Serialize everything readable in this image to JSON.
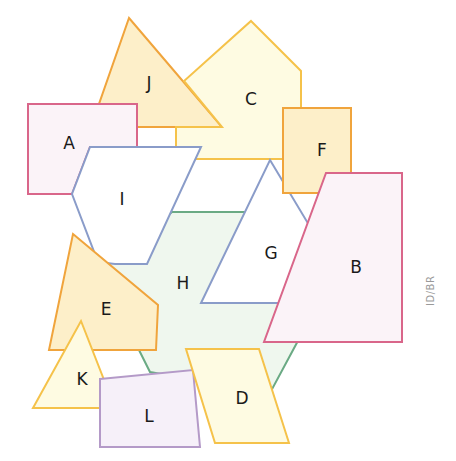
{
  "diagram": {
    "credit": "ID/BR",
    "colors": {
      "pink_stroke": "#d9668a",
      "pink_fill": "#fbf3f8",
      "orange_stroke": "#f0a43c",
      "orange_fill": "#fdefc9",
      "yellow_stroke": "#f5c24a",
      "yellow_fill": "#fefbe2",
      "blue_stroke": "#8a9cc9",
      "blue_fill": "#ffffff",
      "green_stroke": "#6aaa84",
      "green_fill": "#eff7ee",
      "purple_stroke": "#b49ac8",
      "purple_fill": "#f6f0f9"
    },
    "shapes": [
      {
        "label": "H",
        "type": "hexagon",
        "points": "172,212 274,212 300,337 270,393 150,372 100,272",
        "stroke": "#6aaa84",
        "fill": "#eff7ee",
        "label_pos": [
          183,
          283
        ]
      },
      {
        "label": "J",
        "type": "triangle",
        "points": "129,18 222,127 99,127 99,104",
        "stroke": "#f0a43c",
        "fill": "#fdefc9",
        "label_pos": [
          149,
          83
        ]
      },
      {
        "label": "C",
        "type": "pentagon",
        "points": "251,21 301,71 301,159 176,159 176,127 222,127 184,81",
        "stroke": "#f5c24a",
        "fill": "#fefbe2",
        "label_pos": [
          251,
          99
        ]
      },
      {
        "label": "A",
        "type": "rectangle",
        "points": "28,104 137,104 137,147 90,147 72,194 28,194",
        "stroke": "#d9668a",
        "fill": "#fbf3f8",
        "label_pos": [
          69,
          143
        ]
      },
      {
        "label": "G",
        "type": "quadrilateral",
        "points": "270,160 312,230 327,303 201,303",
        "stroke": "#8a9cc9",
        "fill": "#ffffff",
        "label_pos": [
          271,
          253
        ]
      },
      {
        "label": "I",
        "type": "hexagon",
        "points": "90,147 201,147 147,264 115,264 98,262 72,194",
        "stroke": "#8a9cc9",
        "fill": "#ffffff",
        "label_pos": [
          122,
          199
        ]
      },
      {
        "label": "F",
        "type": "rectangle",
        "points": "283,108 351,108 351,193 283,193",
        "stroke": "#f0a43c",
        "fill": "#fdefc9",
        "label_pos": [
          322,
          150
        ]
      },
      {
        "label": "B",
        "type": "quadrilateral",
        "points": "326,173 402,173 402,342 264,342",
        "stroke": "#d9668a",
        "fill": "#fbf3f8",
        "label_pos": [
          356,
          267
        ]
      },
      {
        "label": "E",
        "type": "pentagon",
        "points": "73,234 158,305 156,350 49,350",
        "stroke": "#f0a43c",
        "fill": "#fdefc9",
        "label_pos": [
          106,
          309
        ]
      },
      {
        "label": "K",
        "type": "triangle",
        "points": "81,321 115,408 33,408",
        "stroke": "#f5c24a",
        "fill": "#fefbe2",
        "label_pos": [
          82,
          379
        ]
      },
      {
        "label": "L",
        "type": "quadrilateral",
        "points": "100,379 193,370 200,447 100,447",
        "stroke": "#b49ac8",
        "fill": "#f6f0f9",
        "label_pos": [
          149,
          416
        ]
      },
      {
        "label": "D",
        "type": "parallelogram",
        "points": "186,349 259,349 289,443 215,443",
        "stroke": "#f5c24a",
        "fill": "#fefbe2",
        "label_pos": [
          242,
          398
        ]
      }
    ]
  }
}
